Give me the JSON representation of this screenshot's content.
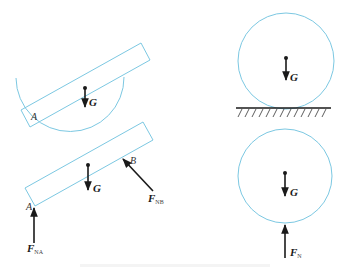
{
  "figure": {
    "type": "free-body diagrams",
    "colors": {
      "outline": "#7cc8e2",
      "force": "#1a1a1a",
      "ground": "#1a1a1a"
    },
    "panels": [
      {
        "id": "rod-in-bowl",
        "description": "Rod resting in a hemispherical bowl",
        "labels": {
          "point_a": "A",
          "gravity": "G"
        }
      },
      {
        "id": "rod-free-body",
        "description": "Free-body diagram of the rod",
        "labels": {
          "point_a": "A",
          "point_b": "B",
          "gravity": "G",
          "force_na_main": "F",
          "force_na_sub": "NA",
          "force_nb_main": "F",
          "force_nb_sub": "NB"
        }
      },
      {
        "id": "ball-on-ground",
        "description": "Ball resting on horizontal ground",
        "labels": {
          "gravity": "G"
        }
      },
      {
        "id": "ball-free-body",
        "description": "Free-body diagram of the ball",
        "labels": {
          "gravity": "G",
          "force_n_main": "F",
          "force_n_sub": "N"
        }
      }
    ]
  }
}
